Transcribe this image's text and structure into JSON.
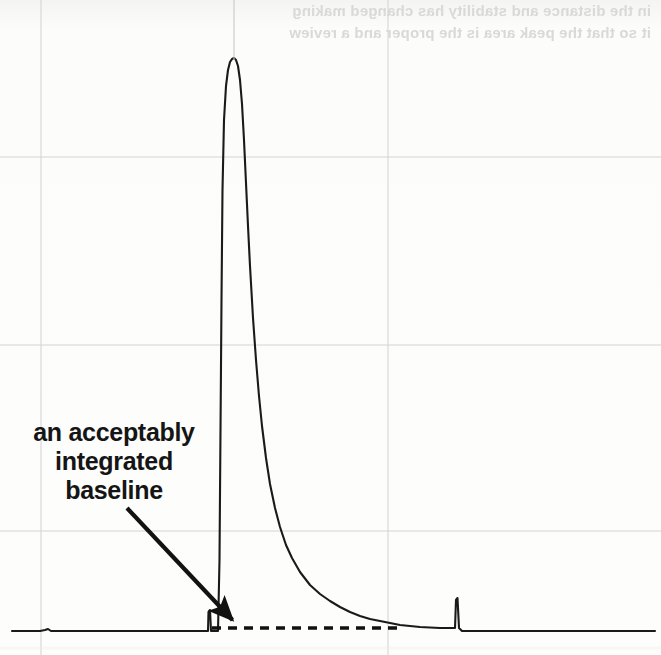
{
  "figure": {
    "kind": "chromatogram-figure",
    "background_color": "#fbfbf9",
    "ink_color": "#1a1a1a",
    "gridline_color": "#d2d2d2",
    "bleed_through": {
      "line1": "in the distance and stability has changed making",
      "line2": "it so that the peak area is the proper and a review"
    },
    "annotation": {
      "line1": "an acceptably",
      "line2": "integrated",
      "line3": "baseline",
      "full_text": "an acceptably integrated baseline",
      "color": "#151515",
      "arrow_name": "annotation-arrow",
      "arrow_from_x": 127,
      "arrow_from_y": 508,
      "arrow_to_x": 240,
      "arrow_to_y": 628
    }
  },
  "chart_data": {
    "type": "line",
    "title": "",
    "subtitle": "",
    "xlabel": "",
    "ylabel": "",
    "grid": true,
    "legend": "none",
    "xlim": [
      0,
      661
    ],
    "ylim": [
      0,
      655
    ],
    "axis_note": "Unlabeled chromatogram: retention time on x, detector signal on y. No tick labels are printed in the figure.",
    "gridlines": {
      "vertical_x": [
        41,
        388
      ],
      "horizontal_y": [
        157,
        345,
        531
      ]
    },
    "baseline_y": 631,
    "series": [
      {
        "name": "chromatogram-trace",
        "color": "#1a1a1a",
        "points": [
          [
            12,
            631
          ],
          [
            40,
            631
          ],
          [
            45,
            630
          ],
          [
            48,
            629
          ],
          [
            51,
            631
          ],
          [
            120,
            631
          ],
          [
            180,
            631
          ],
          [
            205,
            631
          ],
          [
            208,
            631
          ],
          [
            208.5,
            612
          ],
          [
            210,
            610
          ],
          [
            211,
            631
          ],
          [
            213,
            631
          ],
          [
            218,
            631
          ],
          [
            219.5,
            560
          ],
          [
            220.5,
            430
          ],
          [
            221.5,
            300
          ],
          [
            222.5,
            190
          ],
          [
            224,
            120
          ],
          [
            226,
            86
          ],
          [
            228,
            70
          ],
          [
            230,
            62
          ],
          [
            232,
            59
          ],
          [
            234,
            58
          ],
          [
            236,
            60
          ],
          [
            238,
            66
          ],
          [
            240,
            80
          ],
          [
            242,
            104
          ],
          [
            244,
            140
          ],
          [
            246,
            183
          ],
          [
            248,
            226
          ],
          [
            250,
            266
          ],
          [
            253,
            318
          ],
          [
            256,
            360
          ],
          [
            259,
            396
          ],
          [
            262,
            426
          ],
          [
            266,
            458
          ],
          [
            270,
            484
          ],
          [
            275,
            508
          ],
          [
            280,
            527
          ],
          [
            286,
            545
          ],
          [
            292,
            558
          ],
          [
            300,
            572
          ],
          [
            310,
            585
          ],
          [
            320,
            594
          ],
          [
            330,
            601
          ],
          [
            340,
            607
          ],
          [
            350,
            612
          ],
          [
            360,
            616
          ],
          [
            370,
            619
          ],
          [
            380,
            621
          ],
          [
            390,
            623
          ],
          [
            400,
            625
          ],
          [
            410,
            626
          ],
          [
            420,
            627
          ],
          [
            430,
            627.5
          ],
          [
            440,
            628
          ],
          [
            450,
            628
          ],
          [
            455,
            628
          ],
          [
            456,
            600
          ],
          [
            457.5,
            598
          ],
          [
            459,
            628
          ],
          [
            462,
            631
          ],
          [
            480,
            631
          ],
          [
            520,
            631
          ],
          [
            560,
            631
          ],
          [
            600,
            631
          ],
          [
            640,
            631
          ],
          [
            655,
            631
          ]
        ],
        "peak": {
          "apex_x": 234,
          "apex_y": 58,
          "label": "main-peak"
        },
        "minor_peaks": [
          {
            "x": 209,
            "y": 610,
            "label": "pre-peak-spike"
          },
          {
            "x": 457,
            "y": 598,
            "label": "late-eluting-spike"
          },
          {
            "x": 47,
            "y": 629,
            "label": "baseline-bump"
          }
        ]
      },
      {
        "name": "integrated-baseline-dashed",
        "style": "dashed",
        "color": "#111111",
        "dash_pattern": "9 7",
        "y": 628,
        "x_start": 212,
        "x_end": 398
      }
    ]
  }
}
